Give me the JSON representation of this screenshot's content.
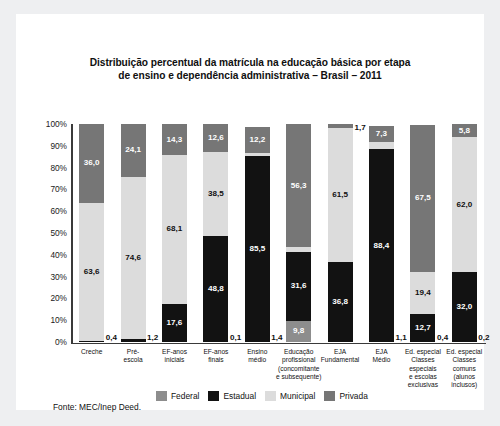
{
  "title": "Distribuição percentual da matrícula na educação básica por etapa de ensino e dependência administrativa – Brasil – 2011",
  "title_line1": "Distribuição percentual da matrícula na educação básica por etapa",
  "title_line2": "de ensino e dependência administrativa – Brasil – 2011",
  "source": "Fonte: MEC/Inep Deed.",
  "colors": {
    "federal": "#8d8d8d",
    "estadual": "#121212",
    "municipal": "#dcdcdc",
    "privada": "#767676",
    "axis": "#3a3a3a",
    "panel": "#ffffff",
    "frame": "#eeeff1"
  },
  "chart_data": {
    "type": "bar",
    "subtype": "stacked-100-percent",
    "title": "Distribuição percentual da matrícula na educação básica por etapa de ensino e dependência administrativa – Brasil – 2011",
    "xlabel": "",
    "ylabel": "",
    "ylim": [
      0,
      100
    ],
    "yticks": [
      "0%",
      "10%",
      "20%",
      "30%",
      "40%",
      "50%",
      "60%",
      "70%",
      "80%",
      "90%",
      "100%"
    ],
    "grid": false,
    "legend_position": "bottom",
    "categories": [
      "Creche",
      "Pré-escola",
      "EF-anos iniciais",
      "EF-anos finais",
      "Ensino médio",
      "Educação profissional (concomitante e subsequente)",
      "EJA Fundamental",
      "EJA Médio",
      "Ed. especial Classes especiais e escolas exclusivas",
      "Ed. especial Classes comuns (alunos inclusos)"
    ],
    "category_label_lines": [
      [
        "Creche"
      ],
      [
        "Pré-",
        "escola"
      ],
      [
        "EF-anos",
        "iniciais"
      ],
      [
        "EF-anos",
        "finais"
      ],
      [
        "Ensino",
        "médio"
      ],
      [
        "Educação",
        "profissional",
        "(concomitante",
        "e subsequente)"
      ],
      [
        "EJA",
        "Fundamental"
      ],
      [
        "EJA",
        "Médio"
      ],
      [
        "Ed. especial",
        "Classes",
        "especiais",
        "e escolas",
        "exclusivas"
      ],
      [
        "Ed. especial",
        "Classes",
        "comuns",
        "(alunos",
        "inclusos)"
      ]
    ],
    "series": [
      {
        "name": "Federal",
        "key": "federal",
        "color": "#8d8d8d",
        "values": [
          0,
          0,
          0,
          0,
          0,
          9.8,
          0,
          0,
          0,
          0
        ],
        "labels": [
          "",
          "",
          "",
          "",
          "",
          "9,8",
          "",
          "",
          "",
          ""
        ]
      },
      {
        "name": "Estadual",
        "key": "estadual",
        "color": "#121212",
        "values": [
          0.4,
          1.2,
          17.6,
          48.8,
          85.5,
          31.6,
          36.8,
          88.4,
          12.7,
          32.0
        ],
        "labels": [
          "0,4",
          "1,2",
          "17,6",
          "48,8",
          "85,5",
          "31,6",
          "36,8",
          "88,4",
          "12,7",
          "32,0"
        ]
      },
      {
        "name": "Municipal",
        "key": "municipal",
        "color": "#dcdcdc",
        "values": [
          63.6,
          74.6,
          68.1,
          38.5,
          1.0,
          2.2,
          61.5,
          3.2,
          19.4,
          62.0
        ],
        "labels": [
          "63,6",
          "74,6",
          "68,1",
          "38,5",
          "1,0",
          "2,2",
          "61,5",
          "3,2",
          "19,4",
          "62,0"
        ]
      },
      {
        "name": "Privada",
        "key": "privada",
        "color": "#767676",
        "values": [
          36.0,
          24.1,
          14.3,
          12.6,
          12.2,
          56.3,
          1.7,
          7.3,
          67.5,
          5.8
        ],
        "labels": [
          "36,0",
          "24,1",
          "14,3",
          "12,6",
          "12,2",
          "56,3",
          "1,7",
          "7,3",
          "67,5",
          "5,8"
        ]
      }
    ],
    "zero_value_labels_outside": [
      {
        "category": "Creche",
        "series": "Estadual",
        "label": "0,4"
      },
      {
        "category": "Pré-escola",
        "series": "Estadual",
        "label": "1,2"
      },
      {
        "category": "EF-anos finais",
        "series": "Estadual",
        "label": "0,1"
      },
      {
        "category": "Ensino médio",
        "series": "Estadual",
        "label": "1,4"
      },
      {
        "category": "EJA Médio",
        "series": "Estadual",
        "label": "1,1"
      },
      {
        "category": "Ed. especial Classes especiais e escolas exclusivas",
        "series": "Federal",
        "label": "0,4"
      },
      {
        "category": "Ed. especial Classes comuns (alunos inclusos)",
        "series": "Federal",
        "label": "0,2"
      }
    ]
  }
}
